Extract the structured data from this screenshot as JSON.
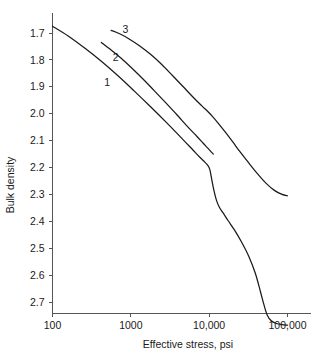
{
  "chart_data": {
    "type": "line",
    "title": "",
    "subtitle": "",
    "xlabel": "Effective stress, psi",
    "ylabel": "Bulk density",
    "x_scale": "log",
    "y_scale": "linear",
    "y_inverted": true,
    "grid": false,
    "legend": "inline-curve-labels",
    "xlim": [
      100,
      100000
    ],
    "ylim": [
      1.675,
      2.79
    ],
    "xticks": [
      100,
      1000,
      10000,
      100000
    ],
    "xtick_labels": [
      "100",
      "1000",
      "10,000",
      "100,000"
    ],
    "yticks": [
      1.7,
      1.8,
      1.9,
      2.0,
      2.1,
      2.2,
      2.3,
      2.4,
      2.5,
      2.6,
      2.7
    ],
    "ytick_labels": [
      "1.7",
      "1.8",
      "1.9",
      "2.0",
      "2.1",
      "2.2",
      "2.3",
      "2.4",
      "2.5",
      "2.6",
      "2.7"
    ],
    "series": [
      {
        "name": "1",
        "label": "1",
        "label_x": 500,
        "label_y": 1.885,
        "points": [
          [
            100,
            1.675
          ],
          [
            160,
            1.712
          ],
          [
            260,
            1.757
          ],
          [
            420,
            1.805
          ],
          [
            680,
            1.858
          ],
          [
            1100,
            1.915
          ],
          [
            1800,
            1.975
          ],
          [
            2900,
            2.035
          ],
          [
            4700,
            2.098
          ],
          [
            6200,
            2.135
          ],
          [
            7600,
            2.162
          ],
          [
            8800,
            2.18
          ],
          [
            9600,
            2.192
          ],
          [
            10200,
            2.208
          ],
          [
            10800,
            2.245
          ],
          [
            11500,
            2.285
          ],
          [
            12400,
            2.322
          ],
          [
            13500,
            2.348
          ],
          [
            15000,
            2.368
          ],
          [
            17500,
            2.398
          ],
          [
            21000,
            2.432
          ],
          [
            26000,
            2.478
          ],
          [
            32000,
            2.53
          ],
          [
            39000,
            2.595
          ],
          [
            45000,
            2.66
          ],
          [
            50000,
            2.71
          ],
          [
            55000,
            2.748
          ],
          [
            62000,
            2.77
          ],
          [
            72000,
            2.78
          ],
          [
            85000,
            2.784
          ],
          [
            100000,
            2.786
          ]
        ]
      },
      {
        "name": "2",
        "label": "2",
        "label_x": 640,
        "label_y": 1.79,
        "points": [
          [
            420,
            1.735
          ],
          [
            560,
            1.763
          ],
          [
            760,
            1.795
          ],
          [
            1050,
            1.833
          ],
          [
            1450,
            1.873
          ],
          [
            2000,
            1.915
          ],
          [
            2800,
            1.96
          ],
          [
            3900,
            2.005
          ],
          [
            5300,
            2.048
          ],
          [
            6900,
            2.083
          ],
          [
            8400,
            2.11
          ],
          [
            9600,
            2.128
          ],
          [
            10600,
            2.142
          ],
          [
            11300,
            2.15
          ]
        ]
      },
      {
        "name": "3",
        "label": "3",
        "label_x": 850,
        "label_y": 1.688,
        "points": [
          [
            560,
            1.69
          ],
          [
            720,
            1.703
          ],
          [
            950,
            1.722
          ],
          [
            1300,
            1.748
          ],
          [
            1800,
            1.78
          ],
          [
            2500,
            1.818
          ],
          [
            3400,
            1.858
          ],
          [
            4600,
            1.898
          ],
          [
            6200,
            1.938
          ],
          [
            8000,
            1.97
          ],
          [
            9600,
            1.992
          ],
          [
            11000,
            2.01
          ],
          [
            13000,
            2.035
          ],
          [
            16000,
            2.068
          ],
          [
            20000,
            2.105
          ],
          [
            25000,
            2.143
          ],
          [
            32000,
            2.183
          ],
          [
            41000,
            2.222
          ],
          [
            53000,
            2.258
          ],
          [
            68000,
            2.285
          ],
          [
            85000,
            2.3
          ],
          [
            100000,
            2.305
          ]
        ]
      }
    ]
  }
}
